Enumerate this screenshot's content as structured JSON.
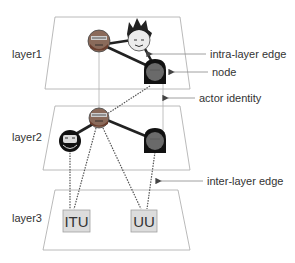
{
  "diagram": {
    "type": "multilayer-network",
    "colors": {
      "plane_stroke": "#a8a8a8",
      "edge": "#222222",
      "interlayer_edge": "#555555",
      "actor_identity": "#b0b0b0",
      "box_fill": "#dcdcdc",
      "box_stroke": "#a0a0a0",
      "text": "#333333",
      "arrow": "#444444"
    },
    "layers": [
      {
        "id": "layer1",
        "label": "layer1"
      },
      {
        "id": "layer2",
        "label": "layer2"
      },
      {
        "id": "layer3",
        "label": "layer3"
      }
    ],
    "nodes": {
      "layer1": [
        {
          "id": "a",
          "avatar": "bearded-glasses-face"
        },
        {
          "id": "b",
          "avatar": "spiky-hair-face"
        },
        {
          "id": "c",
          "avatar": "dark-hooded-face"
        }
      ],
      "layer2": [
        {
          "id": "a",
          "avatar": "bearded-glasses-face"
        },
        {
          "id": "d",
          "avatar": "dark-bearded-face"
        },
        {
          "id": "c",
          "avatar": "dark-hooded-face"
        }
      ],
      "layer3": [
        {
          "id": "itu",
          "label": "ITU"
        },
        {
          "id": "uu",
          "label": "UU"
        }
      ]
    },
    "annotations": [
      {
        "id": "intra",
        "label": "intra-layer edge"
      },
      {
        "id": "node",
        "label": "node"
      },
      {
        "id": "actor",
        "label": "actor identity"
      },
      {
        "id": "inter",
        "label": "inter-layer edge"
      }
    ]
  }
}
